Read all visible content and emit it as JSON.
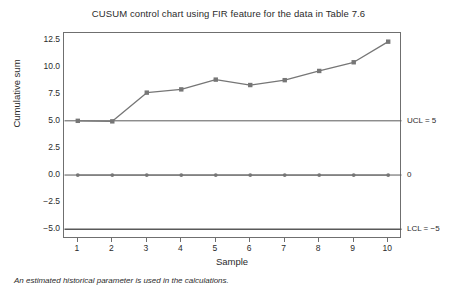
{
  "chart_data": {
    "type": "line",
    "title": "CUSUM control chart using FIR feature for the data in Table 7.6",
    "xlabel": "Sample",
    "ylabel": "Cumulative sum",
    "x": [
      1,
      2,
      3,
      4,
      5,
      6,
      7,
      8,
      9,
      10
    ],
    "xtick_labels": [
      "1",
      "2",
      "3",
      "4",
      "5",
      "6",
      "7",
      "8",
      "9",
      "10"
    ],
    "ytick_labels": [
      "12.5",
      "10.0",
      "7.5",
      "5.0",
      "2.5",
      "0.0",
      "-2.5",
      "-5.0"
    ],
    "ytick_values": [
      12.5,
      10.0,
      7.5,
      5.0,
      2.5,
      0.0,
      -2.5,
      -5.0
    ],
    "xlim": [
      0.6,
      10.4
    ],
    "ylim": [
      -5.9,
      13.1
    ],
    "grid": false,
    "legend": false,
    "series": [
      {
        "name": "Upper cumulative sum",
        "marker": "square",
        "color": "#767676",
        "values": [
          5.0,
          4.95,
          7.6,
          7.9,
          8.8,
          8.3,
          8.75,
          9.6,
          10.4,
          12.3
        ]
      },
      {
        "name": "Lower cumulative sum",
        "marker": "circle",
        "color": "#767676",
        "values": [
          0,
          0,
          0,
          0,
          0,
          0,
          0,
          0,
          0,
          0
        ]
      }
    ],
    "reference_lines": [
      {
        "name": "ucl",
        "value": 5,
        "label": "UCL = 5",
        "color": "#595959"
      },
      {
        "name": "center",
        "value": 0,
        "label": "0",
        "color": "#595959"
      },
      {
        "name": "lcl",
        "value": -5,
        "label": "LCL = −5",
        "color": "#595959"
      }
    ],
    "footnote": "An estimated historical parameter is used in the calculations."
  }
}
